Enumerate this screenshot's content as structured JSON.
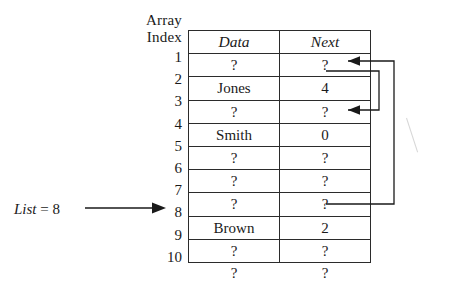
{
  "figure": {
    "index_header_line1": "Array",
    "index_header_line2": "Index",
    "list_pointer": {
      "label_italic": "List",
      "label_rest": " = 8",
      "points_to_index": "7",
      "arrow_icon": "right-arrow-icon"
    },
    "artifact_icon": "scan-streak-artifact"
  },
  "table": {
    "columns": [
      {
        "key": "data",
        "label": "Data"
      },
      {
        "key": "next",
        "label": "Next"
      }
    ],
    "indices": [
      "1",
      "2",
      "3",
      "4",
      "5",
      "6",
      "7",
      "8",
      "9",
      "10"
    ],
    "rows": [
      {
        "index": "1",
        "data": "?",
        "next": "?"
      },
      {
        "index": "2",
        "data": "Jones",
        "next": "4"
      },
      {
        "index": "3",
        "data": "?",
        "next": "?"
      },
      {
        "index": "4",
        "data": "Smith",
        "next": "0"
      },
      {
        "index": "5",
        "data": "?",
        "next": "?"
      },
      {
        "index": "6",
        "data": "?",
        "next": "?"
      },
      {
        "index": "7",
        "data": "?",
        "next": "?"
      },
      {
        "index": "8",
        "data": "Brown",
        "next": "2"
      },
      {
        "index": "9",
        "data": "?",
        "next": "?"
      },
      {
        "index": "10",
        "data": "?",
        "next": "?"
      }
    ]
  },
  "links": [
    {
      "name": "link-from-row-1-to-row-3",
      "from_index": "1",
      "to_index": "3",
      "arrow_icon": "left-arrowhead-icon"
    },
    {
      "name": "link-from-row-7-to-row-1",
      "from_index": "7",
      "to_index": "1",
      "arrow_icon": "left-arrowhead-icon"
    }
  ],
  "colors": {
    "ink": "#1a1a1a",
    "rule": "#2b2b2b",
    "paper": "#ffffff",
    "artifact": "#c9c9c9"
  }
}
